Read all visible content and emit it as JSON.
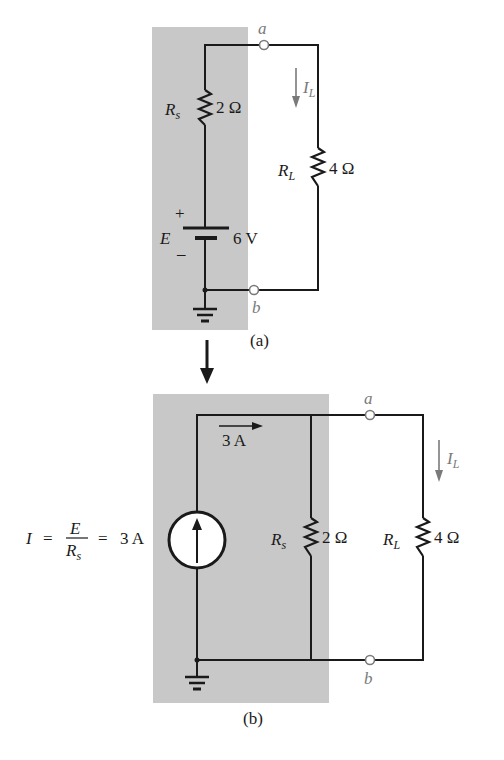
{
  "figure_a": {
    "caption": "(a)",
    "terminal_a": "a",
    "terminal_b": "b",
    "source_resistor": {
      "symbol": "R",
      "sub": "s",
      "value": "2 Ω"
    },
    "load_resistor": {
      "symbol": "R",
      "sub": "L",
      "value": "4 Ω"
    },
    "battery": {
      "symbol": "E",
      "value": "6 V",
      "plus": "+",
      "minus": "–"
    },
    "load_current": {
      "symbol": "I",
      "sub": "L"
    }
  },
  "figure_b": {
    "caption": "(b)",
    "terminal_a": "a",
    "terminal_b": "b",
    "current_label": "3 A",
    "source_equation": {
      "lhs": "I",
      "eq1": "=",
      "num": "E",
      "den_symbol": "R",
      "den_sub": "s",
      "eq2": "=",
      "rhs": "3 A"
    },
    "source_resistor": {
      "symbol": "R",
      "sub": "s",
      "value": "2 Ω"
    },
    "load_resistor": {
      "symbol": "R",
      "sub": "L",
      "value": "4 Ω"
    },
    "load_current": {
      "symbol": "I",
      "sub": "L"
    }
  },
  "colors": {
    "shade": "#c8c8c8",
    "wire": "#1a1a1a",
    "annotation": "#7a7a7a"
  }
}
